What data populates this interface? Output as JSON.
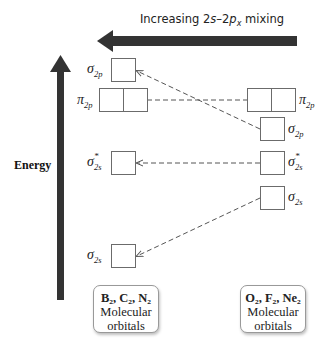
{
  "header": {
    "mixing_label_prefix": "Increasing 2",
    "mixing_label_s": "s",
    "mixing_label_mid": "–2",
    "mixing_label_p": "p",
    "mixing_label_sub": "x",
    "mixing_label_suffix": " mixing",
    "arrow_direction": "left"
  },
  "axis": {
    "label": "Energy",
    "arrow_direction": "up"
  },
  "left_column": {
    "title_formula": "B₂, C₂, N₂",
    "title_line2": "Molecular",
    "title_line3": "orbitals",
    "orbitals": [
      {
        "symbol": "σ",
        "sub": "2p",
        "star": false,
        "boxes": 1
      },
      {
        "symbol": "π",
        "sub": "2p",
        "star": false,
        "boxes": 2
      },
      {
        "symbol": "σ",
        "sub": "2s",
        "star": true,
        "boxes": 1
      },
      {
        "symbol": "σ",
        "sub": "2s",
        "star": false,
        "boxes": 1
      }
    ]
  },
  "right_column": {
    "title_formula": "O₂, F₂, Ne₂",
    "title_line2": "Molecular",
    "title_line3": "orbitals",
    "orbitals": [
      {
        "symbol": "π",
        "sub": "2p",
        "star": false,
        "boxes": 2
      },
      {
        "symbol": "σ",
        "sub": "2p",
        "star": false,
        "boxes": 1
      },
      {
        "symbol": "σ",
        "sub": "2s",
        "star": true,
        "boxes": 1
      },
      {
        "symbol": "σ",
        "sub": "2s",
        "star": false,
        "boxes": 1
      }
    ]
  },
  "labels": {
    "sigma": "σ",
    "pi": "π",
    "star": "*",
    "sub_2p": "2p",
    "sub_2s": "2s"
  },
  "colors": {
    "arrow": "#333333",
    "box_border": "#6b6b6b",
    "dash": "#555555"
  }
}
